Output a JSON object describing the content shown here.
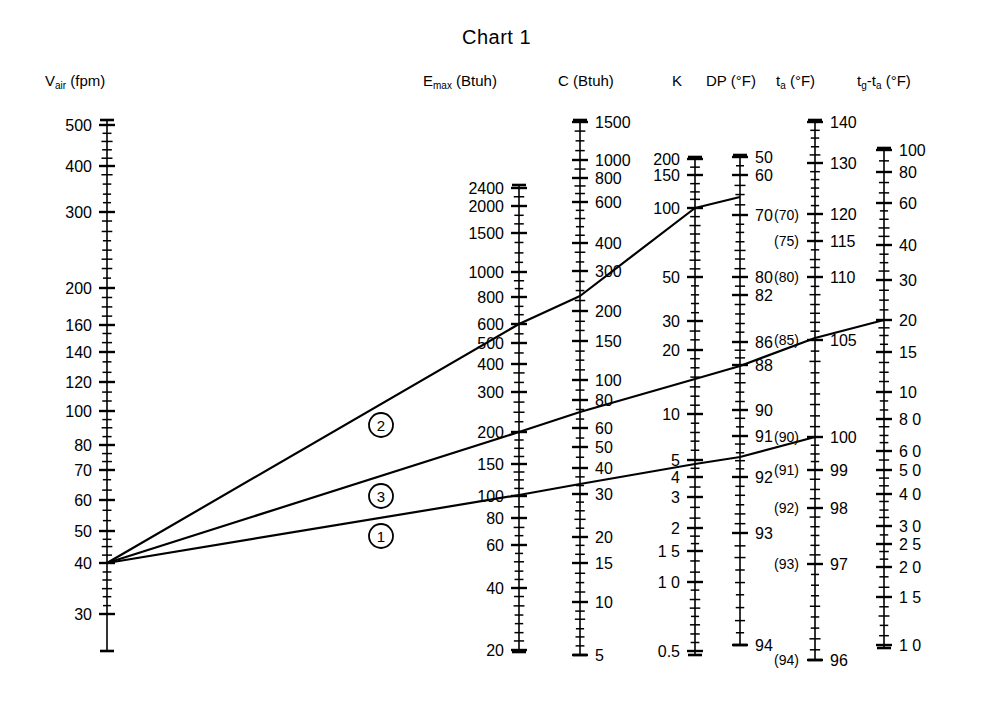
{
  "title": "Chart 1",
  "colors": {
    "ink": "#000000",
    "paper": "#ffffff"
  },
  "headers": {
    "v_air": "V_air (fpm)",
    "v_air_main": "V",
    "v_air_sub": "air",
    "v_air_unit": "(fpm)",
    "emax_main": "E",
    "emax_sub": "max",
    "emax_unit": "(Btuh)",
    "c_label": "C (Btuh)",
    "k_label": "K",
    "dp_label": "DP",
    "dp_unit": "(°F)",
    "ta_main": "t",
    "ta_sub": "a",
    "ta_unit": "(°F)",
    "tg_main": "t",
    "tg_sub": "g",
    "tgta_mid": "-t",
    "tgta_sub": "a",
    "tgta_unit": "(°F)"
  },
  "line_labels": [
    "2",
    "3",
    "1"
  ],
  "chart_data": {
    "type": "line",
    "title": "Chart 1",
    "subtitle": "Nomogram — aligned index lines across seven logarithmic scales",
    "grid": false,
    "legend": "none",
    "xlabel": "",
    "ylabel": "",
    "axes": [
      {
        "name": "V_air",
        "label": "V_air (fpm)",
        "unit": "fpm",
        "scale": "log",
        "side": "left",
        "x": 107,
        "y_top": 120,
        "y_bottom": 651,
        "ticks": [
          {
            "v": 500,
            "y": 125,
            "label": "500",
            "major": true
          },
          {
            "v": 400,
            "y": 166,
            "label": "400",
            "major": true
          },
          {
            "v": 300,
            "y": 212,
            "label": "300",
            "major": true
          },
          {
            "v": 200,
            "y": 288,
            "label": "200",
            "major": true
          },
          {
            "v": 160,
            "y": 325,
            "label": "160",
            "major": true
          },
          {
            "v": 140,
            "y": 352,
            "label": "140",
            "major": true
          },
          {
            "v": 120,
            "y": 382,
            "label": "120",
            "major": true
          },
          {
            "v": 100,
            "y": 411,
            "label": "100",
            "major": true
          },
          {
            "v": 80,
            "y": 445,
            "label": "80",
            "major": true
          },
          {
            "v": 70,
            "y": 470,
            "label": "70",
            "major": true
          },
          {
            "v": 60,
            "y": 500,
            "label": "60",
            "major": true
          },
          {
            "v": 50,
            "y": 531,
            "label": "50",
            "major": true
          },
          {
            "v": 40,
            "y": 563,
            "label": "40",
            "major": true
          },
          {
            "v": 30,
            "y": 614,
            "label": "30",
            "major": true
          }
        ]
      },
      {
        "name": "E_max",
        "label": "E_max (Btuh)",
        "unit": "Btuh",
        "scale": "log",
        "side": "left",
        "x": 519,
        "y_top": 185,
        "y_bottom": 652,
        "ticks": [
          {
            "v": 2400,
            "y": 188,
            "label": "2400",
            "major": true
          },
          {
            "v": 2000,
            "y": 206,
            "label": "2000",
            "major": true
          },
          {
            "v": 1500,
            "y": 233,
            "label": "1500",
            "major": true
          },
          {
            "v": 1000,
            "y": 272,
            "label": "1000",
            "major": true
          },
          {
            "v": 800,
            "y": 297,
            "label": "800",
            "major": true
          },
          {
            "v": 600,
            "y": 324,
            "label": "600",
            "major": true
          },
          {
            "v": 500,
            "y": 343,
            "label": "500",
            "major": true
          },
          {
            "v": 400,
            "y": 364,
            "label": "400",
            "major": true
          },
          {
            "v": 300,
            "y": 392,
            "label": "300",
            "major": true
          },
          {
            "v": 200,
            "y": 432,
            "label": "200",
            "major": true
          },
          {
            "v": 150,
            "y": 464,
            "label": "150",
            "major": true
          },
          {
            "v": 100,
            "y": 496,
            "label": "100",
            "major": true
          },
          {
            "v": 80,
            "y": 518,
            "label": "80",
            "major": true
          },
          {
            "v": 60,
            "y": 545,
            "label": "60",
            "major": true
          },
          {
            "v": 40,
            "y": 588,
            "label": "40",
            "major": true
          },
          {
            "v": 20,
            "y": 650,
            "label": "20",
            "major": true
          }
        ]
      },
      {
        "name": "C",
        "label": "C (Btuh)",
        "unit": "Btuh",
        "scale": "log",
        "side": "right",
        "x": 580,
        "y_top": 120,
        "y_bottom": 655,
        "ticks": [
          {
            "v": 1500,
            "y": 122,
            "label": "1500",
            "major": true
          },
          {
            "v": 1000,
            "y": 160,
            "label": "1000",
            "major": true
          },
          {
            "v": 800,
            "y": 178,
            "label": "800",
            "major": true
          },
          {
            "v": 600,
            "y": 202,
            "label": "600",
            "major": true
          },
          {
            "v": 400,
            "y": 243,
            "label": "400",
            "major": true
          },
          {
            "v": 300,
            "y": 271,
            "label": "300",
            "major": true
          },
          {
            "v": 200,
            "y": 311,
            "label": "200",
            "major": true
          },
          {
            "v": 150,
            "y": 341,
            "label": "150",
            "major": true
          },
          {
            "v": 100,
            "y": 380,
            "label": "100",
            "major": true
          },
          {
            "v": 80,
            "y": 400,
            "label": "80",
            "major": true
          },
          {
            "v": 60,
            "y": 428,
            "label": "60",
            "major": true
          },
          {
            "v": 50,
            "y": 447,
            "label": "50",
            "major": true
          },
          {
            "v": 40,
            "y": 468,
            "label": "40",
            "major": true
          },
          {
            "v": 30,
            "y": 494,
            "label": "30",
            "major": true
          },
          {
            "v": 20,
            "y": 537,
            "label": "20",
            "major": true
          },
          {
            "v": 15,
            "y": 563,
            "label": "15",
            "major": true
          },
          {
            "v": 10,
            "y": 602,
            "label": "10",
            "major": true
          },
          {
            "v": 5,
            "y": 655,
            "label": "5",
            "major": true
          }
        ]
      },
      {
        "name": "K",
        "label": "K",
        "unit": "",
        "scale": "log",
        "side": "left",
        "x": 695,
        "y_top": 157,
        "y_bottom": 655,
        "ticks": [
          {
            "v": 200,
            "y": 159,
            "label": "200",
            "major": true
          },
          {
            "v": 150,
            "y": 175,
            "label": "150",
            "major": true
          },
          {
            "v": 100,
            "y": 208,
            "label": "100",
            "major": true
          },
          {
            "v": 50,
            "y": 277,
            "label": "50",
            "major": true
          },
          {
            "v": 30,
            "y": 321,
            "label": "30",
            "major": true
          },
          {
            "v": 20,
            "y": 350,
            "label": "20",
            "major": true
          },
          {
            "v": 10,
            "y": 414,
            "label": "10",
            "major": true
          },
          {
            "v": 5,
            "y": 460,
            "label": "5",
            "major": true
          },
          {
            "v": 4,
            "y": 477,
            "label": "4",
            "major": true
          },
          {
            "v": 3,
            "y": 497,
            "label": "3",
            "major": true
          },
          {
            "v": 2,
            "y": 528,
            "label": "2",
            "major": true
          },
          {
            "v": 1.5,
            "y": 551,
            "label": "1 5",
            "major": true
          },
          {
            "v": 1.0,
            "y": 582,
            "label": "1 0",
            "major": true
          },
          {
            "v": 0.5,
            "y": 651,
            "label": "0.5",
            "major": true
          }
        ]
      },
      {
        "name": "DP",
        "label": "DP (°F)",
        "unit": "°F",
        "scale": "nonlinear",
        "side": "right",
        "x": 740,
        "y_top": 155,
        "y_bottom": 645,
        "ticks": [
          {
            "v": 50,
            "y": 157,
            "label": "50",
            "major": true
          },
          {
            "v": 60,
            "y": 175,
            "label": "60",
            "major": true
          },
          {
            "v": 70,
            "y": 215,
            "label": "70",
            "major": true
          },
          {
            "v": 80,
            "y": 277,
            "label": "80",
            "major": true
          },
          {
            "v": 82,
            "y": 295,
            "label": "82",
            "major": true
          },
          {
            "v": 86,
            "y": 342,
            "label": "86",
            "major": true
          },
          {
            "v": 88,
            "y": 365,
            "label": "88",
            "major": true
          },
          {
            "v": 90,
            "y": 410,
            "label": "90",
            "major": true
          },
          {
            "v": 91,
            "y": 436,
            "label": "91",
            "major": true
          },
          {
            "v": 92,
            "y": 477,
            "label": "92",
            "major": true
          },
          {
            "v": 93,
            "y": 533,
            "label": "93",
            "major": true
          },
          {
            "v": 94,
            "y": 645,
            "label": "94",
            "major": true
          }
        ]
      },
      {
        "name": "t_a",
        "label": "t_a (°F)",
        "unit": "°F",
        "scale": "nonlinear",
        "side": "right",
        "x": 815,
        "y_top": 120,
        "y_bottom": 660,
        "ticks": [
          {
            "v": 140,
            "y": 122,
            "label": "140",
            "major": true
          },
          {
            "v": 130,
            "y": 163,
            "label": "130",
            "major": true
          },
          {
            "v": 120,
            "y": 214,
            "label": "120",
            "major": true
          },
          {
            "v": 115,
            "y": 241,
            "label": "115",
            "major": true
          },
          {
            "v": 110,
            "y": 277,
            "label": "110",
            "major": true
          },
          {
            "v": 105,
            "y": 340,
            "label": "105",
            "major": true
          },
          {
            "v": 100,
            "y": 437,
            "label": "100",
            "major": true
          },
          {
            "v": 99,
            "y": 470,
            "label": "99",
            "major": true
          },
          {
            "v": 98,
            "y": 508,
            "label": "98",
            "major": true
          },
          {
            "v": 97,
            "y": 564,
            "label": "97",
            "major": true
          },
          {
            "v": 96,
            "y": 660,
            "label": "96",
            "major": true
          }
        ],
        "secondary_scale": {
          "name": "DP_parenthetical",
          "style": "parenthesized",
          "side": "left",
          "ticks": [
            {
              "v": 70,
              "y": 215,
              "label": "(70)"
            },
            {
              "v": 75,
              "y": 241,
              "label": "(75)"
            },
            {
              "v": 80,
              "y": 277,
              "label": "(80)"
            },
            {
              "v": 85,
              "y": 340,
              "label": "(85)"
            },
            {
              "v": 90,
              "y": 437,
              "label": "(90)"
            },
            {
              "v": 91,
              "y": 470,
              "label": "(91)"
            },
            {
              "v": 92,
              "y": 508,
              "label": "(92)"
            },
            {
              "v": 93,
              "y": 564,
              "label": "(93)"
            },
            {
              "v": 94,
              "y": 660,
              "label": "(94)"
            }
          ]
        }
      },
      {
        "name": "tg_minus_ta",
        "label": "t_g - t_a (°F)",
        "unit": "°F",
        "scale": "log",
        "side": "right",
        "x": 884,
        "y_top": 148,
        "y_bottom": 648,
        "ticks": [
          {
            "v": 100,
            "y": 150,
            "label": "100",
            "major": true
          },
          {
            "v": 80,
            "y": 172,
            "label": "80",
            "major": true
          },
          {
            "v": 60,
            "y": 203,
            "label": "60",
            "major": true
          },
          {
            "v": 40,
            "y": 245,
            "label": "40",
            "major": true
          },
          {
            "v": 30,
            "y": 280,
            "label": "30",
            "major": true
          },
          {
            "v": 20,
            "y": 320,
            "label": "20",
            "major": true
          },
          {
            "v": 15,
            "y": 352,
            "label": "15",
            "major": true
          },
          {
            "v": 10,
            "y": 392,
            "label": "10",
            "major": true
          },
          {
            "v": 8.0,
            "y": 419,
            "label": "8 0",
            "major": true
          },
          {
            "v": 6.0,
            "y": 451,
            "label": "6 0",
            "major": true
          },
          {
            "v": 5.0,
            "y": 470,
            "label": "5 0",
            "major": true
          },
          {
            "v": 4.0,
            "y": 494,
            "label": "4 0",
            "major": true
          },
          {
            "v": 3.0,
            "y": 526,
            "label": "3 0",
            "major": true
          },
          {
            "v": 2.5,
            "y": 544,
            "label": "2 5",
            "major": true
          },
          {
            "v": 2.0,
            "y": 567,
            "label": "2 0",
            "major": true
          },
          {
            "v": 1.5,
            "y": 597,
            "label": "1 5",
            "major": true
          },
          {
            "v": 1.0,
            "y": 645,
            "label": "1 0",
            "major": true
          }
        ]
      }
    ],
    "index_lines": [
      {
        "id": "2",
        "label": "2",
        "label_x": 381,
        "label_y": 425,
        "readings": {
          "V_air": 40,
          "E_max": 600,
          "C": 300,
          "K": 100,
          "DP": 70
        },
        "points": [
          [
            107,
            563
          ],
          [
            519,
            324
          ],
          [
            580,
            296
          ],
          [
            695,
            208
          ],
          [
            740,
            197
          ]
        ]
      },
      {
        "id": "3",
        "label": "3",
        "label_x": 381,
        "label_y": 496,
        "readings": {
          "V_air": 40,
          "E_max": 200,
          "C": 80,
          "K": 20,
          "DP": 88,
          "t_a": 105,
          "tg_minus_ta": 20
        },
        "points": [
          [
            107,
            563
          ],
          [
            519,
            432
          ],
          [
            580,
            412
          ],
          [
            695,
            379
          ],
          [
            740,
            366
          ],
          [
            815,
            338
          ],
          [
            884,
            320
          ]
        ]
      },
      {
        "id": "1",
        "label": "1",
        "label_x": 381,
        "label_y": 536,
        "readings": {
          "V_air": 40,
          "E_max": 100,
          "C": 40,
          "K": 5,
          "DP": 92,
          "t_a": 100
        },
        "points": [
          [
            107,
            563
          ],
          [
            519,
            495
          ],
          [
            580,
            484
          ],
          [
            695,
            464
          ],
          [
            740,
            457
          ],
          [
            815,
            437
          ]
        ]
      }
    ]
  }
}
